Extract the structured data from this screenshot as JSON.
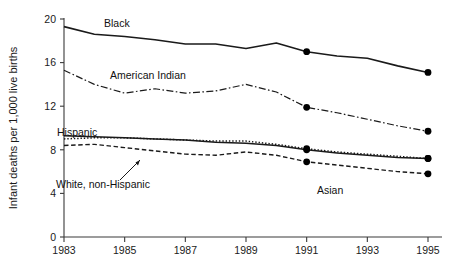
{
  "chart_data": {
    "type": "line",
    "title": "",
    "xlabel": "",
    "ylabel": "Infant deaths per 1,000 live births",
    "xlim": [
      1983,
      1995
    ],
    "ylim": [
      0,
      20
    ],
    "grid": false,
    "legend_position": "inline-labels",
    "x": [
      1983,
      1984,
      1985,
      1986,
      1987,
      1988,
      1989,
      1990,
      1991,
      1992,
      1993,
      1994,
      1995
    ],
    "yticks": [
      0,
      4,
      8,
      12,
      16,
      20
    ],
    "ytick_labels": [
      "0",
      "4",
      "8",
      "12",
      "16",
      "20"
    ],
    "xticks": [
      1983,
      1985,
      1987,
      1989,
      1991,
      1993,
      1995
    ],
    "xtick_labels": [
      "1983",
      "1985",
      "1987",
      "1989",
      "1991",
      "1993",
      "1995"
    ],
    "marker_years": [
      1991,
      1995
    ],
    "series": [
      {
        "name": "Black",
        "style": "solid",
        "width": 1.6,
        "label": "Black",
        "values": [
          19.3,
          18.6,
          18.4,
          18.1,
          17.7,
          17.7,
          17.3,
          17.8,
          17.0,
          16.6,
          16.4,
          15.7,
          15.1
        ]
      },
      {
        "name": "American Indian",
        "style": "dashdot",
        "width": 1.2,
        "label": "American Indian",
        "values": [
          15.3,
          14.0,
          13.2,
          13.6,
          13.2,
          13.4,
          14.0,
          13.3,
          11.9,
          11.4,
          10.8,
          10.2,
          9.7
        ]
      },
      {
        "name": "Hispanic",
        "style": "solid",
        "width": 1.5,
        "label": "Hispanic",
        "values": [
          9.3,
          9.2,
          9.1,
          9.0,
          8.9,
          8.7,
          8.6,
          8.4,
          8.0,
          7.7,
          7.5,
          7.3,
          7.2
        ]
      },
      {
        "name": "White, non-Hispanic",
        "style": "dotted",
        "width": 1.5,
        "label": "White, non-Hispanic",
        "values": [
          9.0,
          9.1,
          9.1,
          9.0,
          8.9,
          8.8,
          8.8,
          8.5,
          8.1,
          7.8,
          7.6,
          7.4,
          7.2
        ]
      },
      {
        "name": "Asian",
        "style": "dashed",
        "width": 1.4,
        "label": "Asian",
        "values": [
          8.4,
          8.5,
          8.2,
          7.9,
          7.6,
          7.5,
          7.8,
          7.5,
          6.9,
          6.6,
          6.3,
          6.0,
          5.8
        ]
      }
    ]
  },
  "colors": {
    "axis": "#3a3a3a",
    "line": "#1a1a1a",
    "marker": "#000000",
    "background": "#ffffff"
  }
}
